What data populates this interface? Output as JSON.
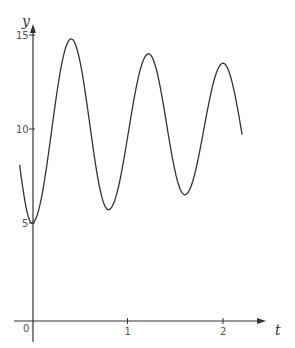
{
  "chart_data": {
    "type": "line",
    "title": "",
    "xlabel": "t",
    "ylabel": "y",
    "xlim": [
      -0.13,
      2.3
    ],
    "ylim": [
      0,
      15.5
    ],
    "grid": false,
    "legend": null,
    "x_ticks": [
      {
        "value": 0,
        "label": "0"
      },
      {
        "value": 1,
        "label": "1"
      },
      {
        "value": 2,
        "label": "2"
      }
    ],
    "y_ticks": [
      {
        "value": 5,
        "label": "5"
      },
      {
        "value": 10,
        "label": "10"
      },
      {
        "value": 15,
        "label": "15"
      }
    ],
    "series": [
      {
        "name": "y(t)",
        "color": "#333333",
        "key_points": [
          {
            "t": -0.13,
            "y": 8.1,
            "kind": "start"
          },
          {
            "t": 0.0,
            "y": 5.0,
            "kind": "min"
          },
          {
            "t": 0.41,
            "y": 14.8,
            "kind": "max"
          },
          {
            "t": 0.8,
            "y": 5.7,
            "kind": "min"
          },
          {
            "t": 1.22,
            "y": 14.0,
            "kind": "max"
          },
          {
            "t": 1.6,
            "y": 6.5,
            "kind": "min"
          },
          {
            "t": 2.0,
            "y": 13.5,
            "kind": "max"
          },
          {
            "t": 2.2,
            "y": 9.7,
            "kind": "end"
          }
        ]
      }
    ]
  },
  "axes": {
    "origin_label": "0",
    "x_title": "t",
    "y_title": "y"
  }
}
